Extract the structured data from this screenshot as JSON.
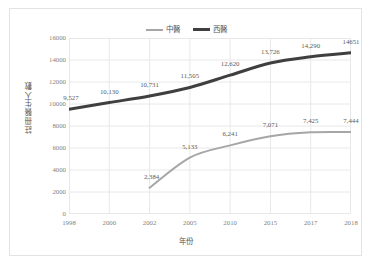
{
  "chart_data": {
    "type": "line",
    "title": "",
    "xlabel": "年份",
    "ylabel": "註冊醫生人數",
    "categories": [
      "1998",
      "2000",
      "2002",
      "2005",
      "2010",
      "2015",
      "2017",
      "2018"
    ],
    "ylim": [
      0,
      16000
    ],
    "yticks": [
      "0",
      "2000",
      "4000",
      "6000",
      "8000",
      "10000",
      "12000",
      "14000",
      "16000"
    ],
    "ytick_values": [
      0,
      2000,
      4000,
      6000,
      8000,
      10000,
      12000,
      14000,
      16000
    ],
    "grid": "both",
    "legend_position": "top-center",
    "series": [
      {
        "name": "中醫",
        "color": "#a6a6a6",
        "line_width": 2,
        "values": [
          null,
          null,
          2384,
          5133,
          6241,
          7071,
          7425,
          7444
        ],
        "labels": [
          "",
          "",
          "2,384",
          "5,133",
          "6,241",
          "7,071",
          "7,425",
          "7,444"
        ]
      },
      {
        "name": "西醫",
        "color": "#3f3f3f",
        "line_width": 3,
        "values": [
          9527,
          10130,
          10731,
          11505,
          12620,
          13726,
          14290,
          14651
        ],
        "labels": [
          "9,527",
          "10,130",
          "10,731",
          "11,505",
          "12,620",
          "13,726",
          "14,290",
          "14651"
        ]
      }
    ]
  },
  "style": {
    "background": "#ffffff",
    "frame_border": "#e3e3e3",
    "gridline": "#e8e8e8",
    "tick_text": "#7f7f7f",
    "axis_title_text": "#595959",
    "data_label_text": "#5a5a5a"
  }
}
